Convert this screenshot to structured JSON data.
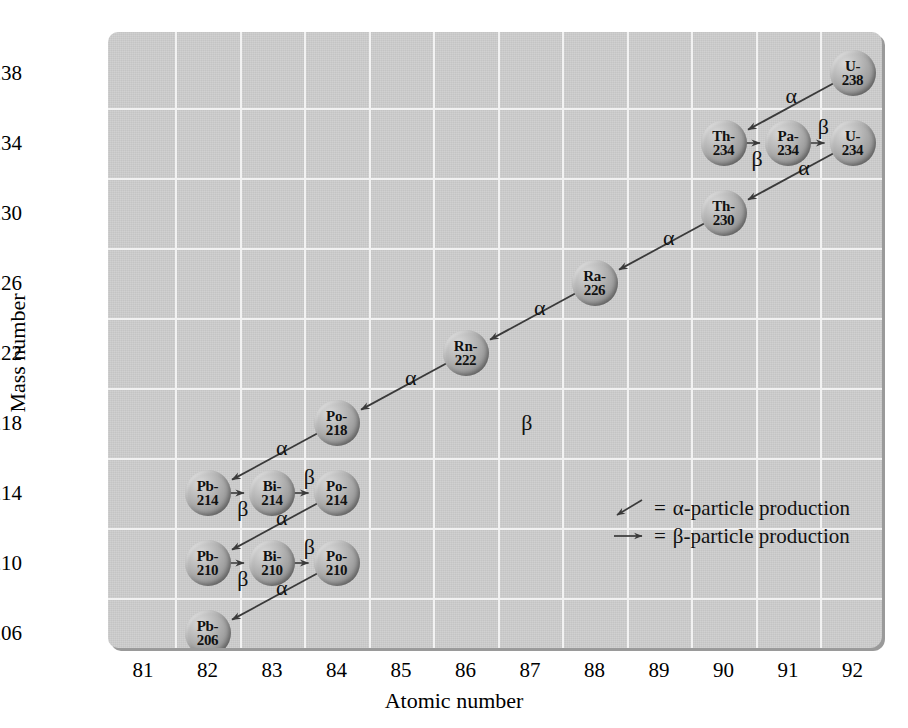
{
  "chart_data": {
    "type": "scatter",
    "title": "",
    "xlabel": "Atomic number",
    "ylabel": "Mass number",
    "xlim": [
      80.5,
      92.5
    ],
    "ylim": [
      204,
      240
    ],
    "xticks": [
      81,
      82,
      83,
      84,
      85,
      86,
      87,
      88,
      89,
      90,
      91,
      92
    ],
    "yticks": [
      206,
      210,
      214,
      218,
      222,
      226,
      230,
      234,
      238
    ],
    "grid": true,
    "legend_position": "center-right",
    "nodes": [
      {
        "id": "U-238",
        "element": "U-",
        "mass": "238",
        "x": 92,
        "y": 238
      },
      {
        "id": "Th-234",
        "element": "Th-",
        "mass": "234",
        "x": 90,
        "y": 234
      },
      {
        "id": "Pa-234",
        "element": "Pa-",
        "mass": "234",
        "x": 91,
        "y": 234
      },
      {
        "id": "U-234",
        "element": "U-",
        "mass": "234",
        "x": 92,
        "y": 234
      },
      {
        "id": "Th-230",
        "element": "Th-",
        "mass": "230",
        "x": 90,
        "y": 230
      },
      {
        "id": "Ra-226",
        "element": "Ra-",
        "mass": "226",
        "x": 88,
        "y": 226
      },
      {
        "id": "Rn-222",
        "element": "Rn-",
        "mass": "222",
        "x": 86,
        "y": 222
      },
      {
        "id": "Po-218",
        "element": "Po-",
        "mass": "218",
        "x": 84,
        "y": 218
      },
      {
        "id": "Pb-214",
        "element": "Pb-",
        "mass": "214",
        "x": 82,
        "y": 214
      },
      {
        "id": "Bi-214",
        "element": "Bi-",
        "mass": "214",
        "x": 83,
        "y": 214
      },
      {
        "id": "Po-214",
        "element": "Po-",
        "mass": "214",
        "x": 84,
        "y": 214
      },
      {
        "id": "Pb-210",
        "element": "Pb-",
        "mass": "210",
        "x": 82,
        "y": 210
      },
      {
        "id": "Bi-210",
        "element": "Bi-",
        "mass": "210",
        "x": 83,
        "y": 210
      },
      {
        "id": "Po-210",
        "element": "Po-",
        "mass": "210",
        "x": 84,
        "y": 210
      },
      {
        "id": "Pb-206",
        "element": "Pb-",
        "mass": "206",
        "x": 82,
        "y": 206
      }
    ],
    "decays": [
      {
        "from": "U-238",
        "to": "Th-234",
        "type": "alpha",
        "label": "α",
        "label_x": 91.05,
        "label_y": 236.7
      },
      {
        "from": "Th-234",
        "to": "Pa-234",
        "type": "beta",
        "label": "β",
        "label_x": 90.52,
        "label_y": 233.1
      },
      {
        "from": "Pa-234",
        "to": "U-234",
        "type": "beta",
        "label": "β",
        "label_x": 91.55,
        "label_y": 234.9
      },
      {
        "from": "U-234",
        "to": "Th-230",
        "type": "alpha",
        "label": "α",
        "label_x": 91.25,
        "label_y": 232.6
      },
      {
        "from": "Th-230",
        "to": "Ra-226",
        "type": "alpha",
        "label": "α",
        "label_x": 89.15,
        "label_y": 228.6
      },
      {
        "from": "Ra-226",
        "to": "Rn-222",
        "type": "alpha",
        "label": "α",
        "label_x": 87.15,
        "label_y": 224.6
      },
      {
        "from": "Rn-222",
        "to": "Po-218",
        "type": "alpha",
        "label": "α",
        "label_x": 85.15,
        "label_y": 220.6
      },
      {
        "from": "Po-218",
        "to": "Pb-214",
        "type": "alpha",
        "label": "α",
        "label_x": 83.15,
        "label_y": 216.6
      },
      {
        "from": "Pb-214",
        "to": "Bi-214",
        "type": "beta",
        "label": "β",
        "label_x": 82.55,
        "label_y": 213.1
      },
      {
        "from": "Bi-214",
        "to": "Po-214",
        "type": "beta",
        "label": "β",
        "label_x": 83.58,
        "label_y": 214.9
      },
      {
        "from": "Po-214",
        "to": "Pb-210",
        "type": "alpha",
        "label": "α",
        "label_x": 83.15,
        "label_y": 212.6
      },
      {
        "from": "Pb-210",
        "to": "Bi-210",
        "type": "beta",
        "label": "β",
        "label_x": 82.55,
        "label_y": 209.1
      },
      {
        "from": "Bi-210",
        "to": "Po-210",
        "type": "beta",
        "label": "β",
        "label_x": 83.58,
        "label_y": 210.9
      },
      {
        "from": "Po-210",
        "to": "Pb-206",
        "type": "alpha",
        "label": "α",
        "label_x": 83.15,
        "label_y": 208.6
      }
    ],
    "stray_labels": [
      {
        "text": "β",
        "x": 86.95,
        "y": 218.0
      }
    ]
  },
  "legend": {
    "rows": [
      {
        "glyph": "alpha-arrow-icon",
        "equals": "=",
        "text": "α-particle production"
      },
      {
        "glyph": "beta-arrow-icon",
        "equals": "=",
        "text": "β-particle production"
      }
    ]
  },
  "colors": {
    "panel_background": "#cccccc",
    "gridline": "#f2f2f2",
    "panel_shadow": "#9a9a9a",
    "arrow": "#3a3a3a",
    "text": "#000000",
    "sphere_light": "#d8d8d8",
    "sphere_dark": "#6f6f6f"
  }
}
